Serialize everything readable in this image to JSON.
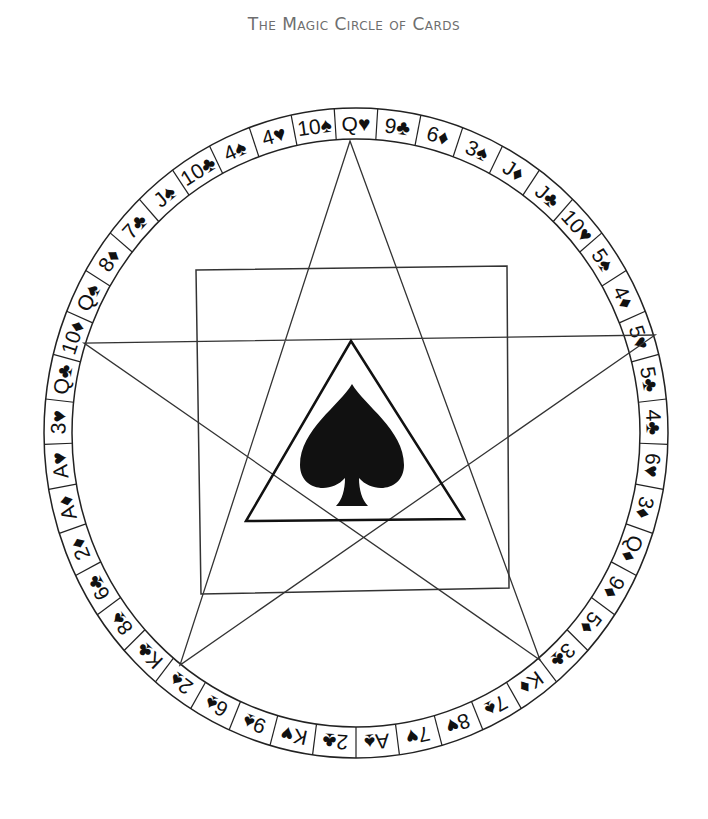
{
  "title": "The Magic Circle of Cards",
  "colors": {
    "ink": "#111111",
    "title": "#6e6e6e",
    "background": "#ffffff"
  },
  "circle": {
    "cx": 356,
    "cy": 433,
    "rx_outer": 312,
    "ry_outer": 325,
    "rx_inner": 284,
    "ry_inner": 294
  },
  "cards": [
    "Q♥",
    "9♣",
    "6♦",
    "3♠",
    "J♦",
    "J♣",
    "10♥",
    "5♠",
    "4♦",
    "5♥",
    "5♣",
    "4♣",
    "6♥",
    "3♦",
    "Q♦",
    "9♦",
    "5♦",
    "3♣",
    "K♦",
    "7♠",
    "8♥",
    "7♥",
    "A♠",
    "2♣",
    "K♥",
    "9♠",
    "6♠",
    "2♠",
    "K♣",
    "8♠",
    "6♣",
    "2♦",
    "A♦",
    "A♥",
    "3♥",
    "Q♣",
    "10♦",
    "Q♠",
    "8♦",
    "7♣",
    "J♠",
    "10♣",
    "4♠",
    "4♥",
    "10♠"
  ],
  "center_symbol": "spade-icon",
  "pentagram_points": [
    [
      350,
      141
    ],
    [
      655,
      335
    ],
    [
      84,
      343
    ],
    [
      540,
      660
    ],
    [
      180,
      665
    ]
  ],
  "square": [
    [
      196,
      270
    ],
    [
      507,
      266
    ],
    [
      509,
      588
    ],
    [
      201,
      594
    ]
  ],
  "triangle": [
    [
      351,
      341
    ],
    [
      464,
      519
    ],
    [
      246,
      521
    ]
  ]
}
